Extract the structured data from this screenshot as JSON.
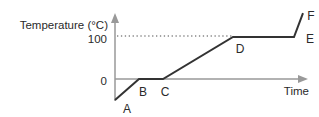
{
  "chart_data": {
    "type": "line",
    "title": "",
    "ylabel": "Temperature (°C)",
    "xlabel": "Time",
    "yticks": [
      100,
      0
    ],
    "dotted_gridline_at": 100,
    "grid": "off",
    "legend": "none",
    "axis_color": "#999999",
    "line_color": "#333333",
    "text_color": "#2a2a2a",
    "dotted_color": "#4a4a4a",
    "points": [
      {
        "label": "A",
        "time": 0,
        "temp": -50
      },
      {
        "label": "B",
        "time": 24,
        "temp": 0
      },
      {
        "label": "C",
        "time": 48,
        "temp": 0
      },
      {
        "label": "D",
        "time": 118,
        "temp": 100
      },
      {
        "label": "E",
        "time": 179,
        "temp": 100
      },
      {
        "label": "F",
        "time": 188,
        "temp": 157
      }
    ]
  }
}
